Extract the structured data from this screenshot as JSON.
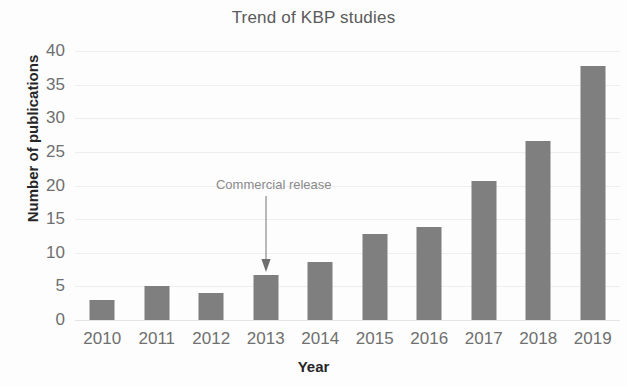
{
  "chart_data": {
    "type": "bar",
    "title": "Trend of KBP studies",
    "xlabel": "Year",
    "ylabel": "Number of publications",
    "categories": [
      "2010",
      "2011",
      "2012",
      "2013",
      "2014",
      "2015",
      "2016",
      "2017",
      "2018",
      "2019"
    ],
    "values": [
      3,
      5,
      4,
      6.7,
      8.6,
      12.8,
      13.8,
      20.7,
      26.6,
      37.7
    ],
    "ylim": [
      0,
      40
    ],
    "yticks": [
      "40",
      "35",
      "30",
      "25",
      "20",
      "15",
      "10",
      "5",
      "0"
    ],
    "ytick_values": [
      40,
      35,
      30,
      25,
      20,
      15,
      10,
      5,
      0
    ],
    "grid": true,
    "legend": "none",
    "bar_color": "#7f7f7f",
    "grid_color": "#eeeeee",
    "text_color": "#6f6f6f",
    "annotations": [
      {
        "text": "Commercial release",
        "target_category": "2013",
        "marker": "down-arrow"
      }
    ]
  }
}
